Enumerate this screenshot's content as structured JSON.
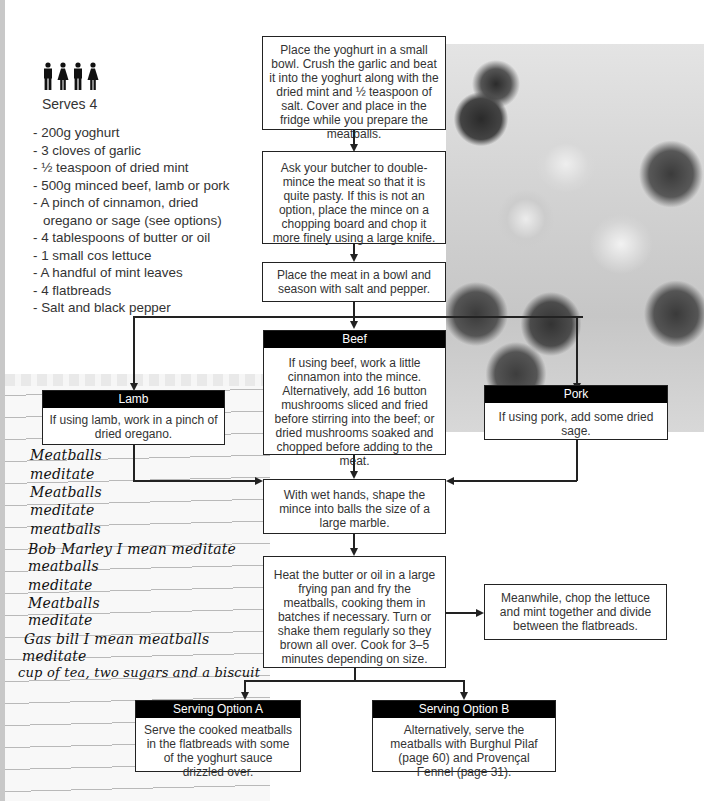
{
  "serves": {
    "icon": "people-icon",
    "people_count": 4,
    "label": "Serves 4"
  },
  "ingredients": [
    "- 200g yoghurt",
    "- 3 cloves of garlic",
    "- ½ teaspoon of dried mint",
    "- 500g minced beef, lamb or pork",
    "- A pinch of cinnamon, dried oregano or sage (see options)",
    "- 4 tablespoons of butter or oil",
    "- 1 small cos lettuce",
    "- A handful of mint leaves",
    "- 4 flatbreads",
    "- Salt and black pepper"
  ],
  "steps": {
    "yoghurt": "Place the yoghurt in a small bowl. Crush the garlic and beat it into the yoghurt along with the dried mint and ½ teaspoon of salt. Cover and place in the fridge while you prepare the meatballs.",
    "butcher": "Ask your butcher to double-mince the meat so that it is quite pasty. If this is not an option, place the mince on a chopping board and chop it more finely using a large knife.",
    "season": "Place the meat in a bowl and season with salt and pepper.",
    "shape": "With wet hands, shape the mince into balls the size of a large marble.",
    "fry": "Heat the butter or oil in a large frying pan and fry the meatballs, cooking them in batches if necessary. Turn or shake them regularly so they brown all over. Cook for 3–5 minutes depending on size.",
    "meanwhile": "Meanwhile, chop the lettuce and mint together and divide between the flatbreads."
  },
  "options": {
    "lamb": {
      "title": "Lamb",
      "text": "If using lamb, work in a pinch of dried oregano."
    },
    "beef": {
      "title": "Beef",
      "text": "If using beef, work a little cinnamon into the mince. Alternatively, add 16 button mushrooms sliced and fried before stirring into the beef; or dried mushrooms soaked and chopped before adding to the meat."
    },
    "pork": {
      "title": "Pork",
      "text": "If using pork, add some dried sage."
    }
  },
  "serving": {
    "a": {
      "title": "Serving Option A",
      "text": "Serve the cooked meatballs in the flatbreads with some of the yoghurt sauce drizzled over."
    },
    "b": {
      "title": "Serving Option B",
      "text": "Alternatively, serve the meatballs with Burghul Pilaf (page 60) and Provençal Fennel (page 31)."
    }
  },
  "notepad": {
    "lines": [
      "Meatballs",
      "meditate",
      "Meatballs",
      "meditate",
      "meatballs",
      "Bob Marley I mean meditate",
      "meatballs",
      "meditate",
      "Meatballs",
      "meditate",
      "Gas bill I mean meatballs",
      "meditate",
      "cup of tea, two sugars and a biscuit"
    ]
  },
  "photo": {
    "subject": "meatballs with yoghurt sauce"
  }
}
